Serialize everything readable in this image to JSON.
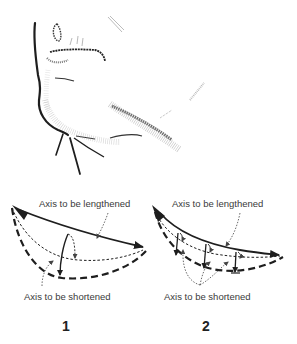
{
  "figure": {
    "illustration": "chin-and-mouth-sketch",
    "panels": [
      {
        "number": "1",
        "label_top": "Axis to be lengthened",
        "label_bottom": "Axis to be shortened"
      },
      {
        "number": "2",
        "label_top": "Axis to be lengthened",
        "label_bottom": "Axis to be shortened"
      }
    ],
    "colors": {
      "ink": "#1e1e1e",
      "label": "#3a3a3a",
      "background": "#ffffff"
    }
  }
}
